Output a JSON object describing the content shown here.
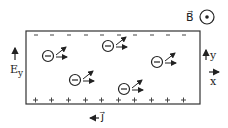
{
  "labels": {
    "b_field": "B⃗",
    "e_field": "E",
    "e_sub": "y",
    "axis_y": "y",
    "axis_x": "x",
    "current": "j⃗"
  },
  "electron_symbol": "−",
  "top_charges": [
    "−",
    "−",
    "−",
    "−",
    "−",
    "−",
    "−",
    "−",
    "−",
    "−"
  ],
  "bottom_charges": [
    "+",
    "+",
    "+",
    "+",
    "+",
    "+",
    "+",
    "+",
    "+",
    "+"
  ],
  "electrons": [
    {
      "x": 48,
      "y": 56
    },
    {
      "x": 108,
      "y": 46
    },
    {
      "x": 75,
      "y": 80
    },
    {
      "x": 124,
      "y": 89
    },
    {
      "x": 157,
      "y": 62
    }
  ],
  "colors": {
    "ink": "#222222",
    "background": "#ffffff"
  }
}
